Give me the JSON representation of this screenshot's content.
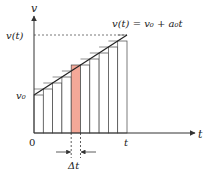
{
  "diagram": {
    "axes": {
      "y_label": "v",
      "x_label": "t",
      "origin_label": "0",
      "x_end_label": "t",
      "y_start_label": "v₀",
      "y_end_label": "v(t)"
    },
    "equation": "v(t) = v₀ + a₀t",
    "interval_label": "Δt",
    "bar_count": 10,
    "highlighted_bar_index": 4,
    "colors": {
      "axis": "#333333",
      "bar_stroke": "#444444",
      "bar_fill": "#ffffff",
      "highlight_fill": "#f4a898",
      "line": "#222222"
    }
  }
}
